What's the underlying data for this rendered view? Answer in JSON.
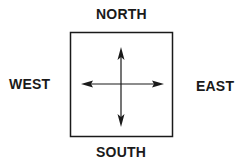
{
  "diagram": {
    "labels": {
      "north": "NORTH",
      "south": "SOUTH",
      "west": "WEST",
      "east": "EAST"
    },
    "box": {
      "x": 70,
      "y": 32,
      "width": 102,
      "height": 104
    },
    "arrows": {
      "horizontal": {
        "x1": 81,
        "x2": 164,
        "y": 84
      },
      "vertical": {
        "x": 121,
        "y1": 47,
        "y2": 127
      }
    },
    "colors": {
      "stroke": "#1a1a1a",
      "background": "#ffffff"
    }
  }
}
